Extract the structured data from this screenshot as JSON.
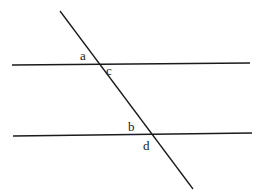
{
  "diagram": {
    "title": "",
    "colors": {
      "background": "#ffffff",
      "stroke": "#1a1a1a"
    },
    "lines": {
      "top_parallel": {
        "x1": 12,
        "y1": 65,
        "x2": 250,
        "y2": 63
      },
      "bottom_parallel": {
        "x1": 13,
        "y1": 136,
        "x2": 252,
        "y2": 133
      },
      "transversal": {
        "x1": 60,
        "y1": 11,
        "x2": 193,
        "y2": 189
      }
    },
    "labels": [
      {
        "id": "a",
        "text": "a",
        "x": 80,
        "y": 60
      },
      {
        "id": "c",
        "text": "c",
        "x": 106,
        "y": 75
      },
      {
        "id": "b",
        "text": "b",
        "x": 128,
        "y": 131
      },
      {
        "id": "d",
        "text": "d",
        "x": 143,
        "y": 150
      }
    ]
  }
}
